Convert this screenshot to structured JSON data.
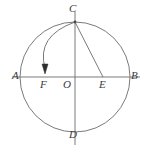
{
  "figure": {
    "background_color": "#ffffff",
    "stroke_color": "#6b6b6b",
    "label_color": "#3a3a3a",
    "circle": {
      "center_label": "O",
      "cx": 75,
      "cy": 77,
      "r": 55
    },
    "axes": {
      "horizontal_line": {
        "x1": 12,
        "y1": 77,
        "x2": 140,
        "y2": 77
      },
      "vertical_line": {
        "x1": 75,
        "y1": 12,
        "x2": 75,
        "y2": 145
      }
    },
    "points": [
      {
        "name": "A",
        "label": "A",
        "x": 20,
        "y": 77,
        "label_x": 12,
        "label_y": 72
      },
      {
        "name": "B",
        "label": "B",
        "x": 130,
        "y": 77,
        "label_x": 131,
        "label_y": 72
      },
      {
        "name": "C",
        "label": "C",
        "x": 75,
        "y": 22,
        "label_x": 69,
        "label_y": 2
      },
      {
        "name": "D",
        "label": "D",
        "x": 75,
        "y": 132,
        "label_x": 69,
        "label_y": 130
      },
      {
        "name": "E",
        "label": "E",
        "x": 103,
        "y": 77,
        "label_x": 99,
        "label_y": 80
      },
      {
        "name": "F",
        "label": "F",
        "x": 44,
        "y": 77,
        "label_x": 40,
        "label_y": 80
      },
      {
        "name": "O",
        "label": "O",
        "x": 75,
        "y": 77,
        "label_x": 64,
        "label_y": 80
      }
    ],
    "segments": [
      {
        "name": "chord-c-to-e",
        "from": "C",
        "to": "E"
      }
    ],
    "arcs": [
      {
        "name": "arc-c-to-f",
        "from": "C",
        "to": "F",
        "has_arrowhead": true,
        "arrow_at": "F",
        "arrow_direction": "down"
      }
    ]
  }
}
